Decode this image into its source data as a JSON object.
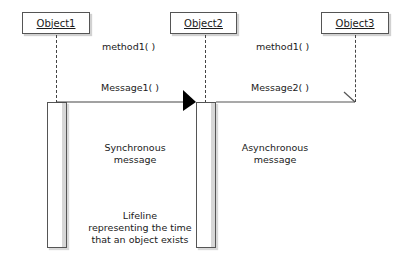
{
  "diagram": {
    "type": "UML sequence diagram",
    "objects": [
      {
        "id": "obj1",
        "label": "Object1"
      },
      {
        "id": "obj2",
        "label": "Object2"
      },
      {
        "id": "obj3",
        "label": "Object3"
      }
    ],
    "methods": [
      {
        "label": "method1( )",
        "between": [
          "Object1",
          "Object2"
        ]
      },
      {
        "label": "method1( )",
        "between": [
          "Object2",
          "Object3"
        ]
      }
    ],
    "messages": [
      {
        "label": "Message1( )",
        "from": "Object1",
        "to": "Object2",
        "kind": "synchronous"
      },
      {
        "label": "Message2( )",
        "from": "Object2",
        "to": "Object3",
        "kind": "asynchronous"
      }
    ],
    "annotations": {
      "synchronous": [
        "Synchronous",
        "message"
      ],
      "asynchronous": [
        "Asynchronous",
        "message"
      ],
      "lifeline": [
        "Lifeline",
        "representing the time",
        "that an object exists"
      ]
    },
    "colors": {
      "line": "#444444",
      "box_border": "#555555",
      "arrowhead": "#000000",
      "activation_shadow": "#d7d7d7",
      "background": "#ffffff"
    }
  }
}
